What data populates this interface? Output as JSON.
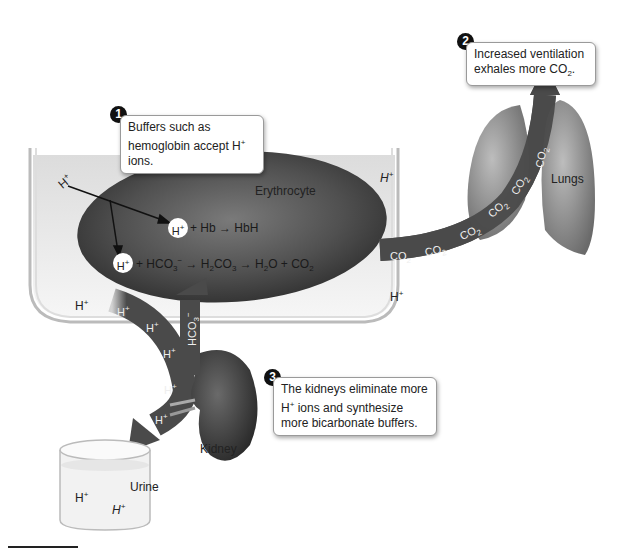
{
  "callouts": [
    {
      "number": "1",
      "line1": "Buffers such as",
      "line2": "hemoglobin accept H",
      "line2_sup": "+",
      "line2_end": " ions."
    },
    {
      "number": "2",
      "line1": "Increased ventilation",
      "line2": "exhales more CO",
      "line2_sub": "2",
      "line2_end": "."
    },
    {
      "number": "3",
      "line1": "The kidneys eliminate more",
      "line2_pre": "H",
      "line2_sup": "+",
      "line2": " ions and synthesize",
      "line3": "more bicarbonate buffers."
    }
  ],
  "labels": {
    "erythrocyte": "Erythrocyte",
    "lungs": "Lungs",
    "kidney": "Kidney",
    "urine": "Urine"
  },
  "ions": {
    "h": "H",
    "plus": "+",
    "co2": "CO",
    "two": "2",
    "hco3": "HCO",
    "three": "3",
    "minus": "−"
  },
  "reactions": {
    "r1_lhs": "+ Hb",
    "r1_rhs": "HbH",
    "r2_lhs": "+ HCO",
    "r2_mid": "H",
    "r2_mid2": "CO",
    "r2_rhs": "H",
    "r2_rhs2": "O + CO"
  },
  "colors": {
    "plasma": "#e2e2e2",
    "cell_dark": "#3a3a3a",
    "arrow_dark": "#4a4a4a",
    "callout_border": "#9a9a9a"
  }
}
